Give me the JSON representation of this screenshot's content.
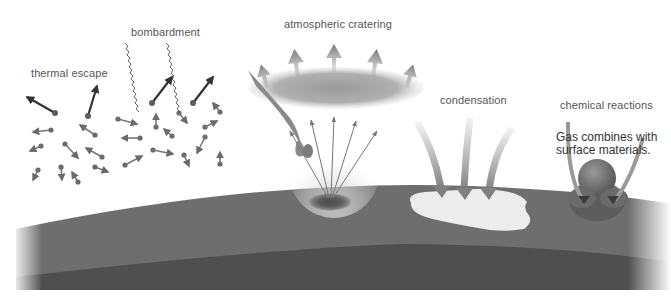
{
  "diagram": {
    "labels": {
      "thermal_escape": "thermal escape",
      "bombardment": "bombardment",
      "atmospheric_cratering": "atmospheric cratering",
      "condensation": "condensation",
      "chemical_reactions": "chemical reactions",
      "chemical_note_line1": "Gas combines with",
      "chemical_note_line2": "surface materials."
    },
    "colors": {
      "background": "#ffffff",
      "surface_crust": "#6e6e6e",
      "surface_deep": "#4f4f4f",
      "molecule": "#6a6a6a",
      "arrow_light": "#8a8a8a",
      "condensate": "#ececec",
      "text": "#555555"
    }
  }
}
